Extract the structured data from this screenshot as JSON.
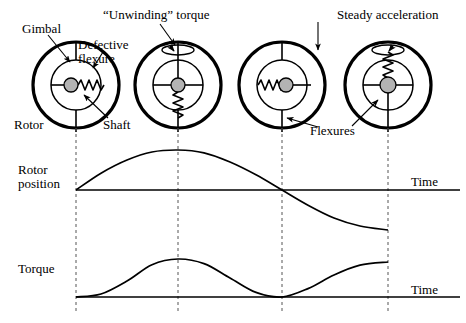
{
  "figure": {
    "background": "#ffffff",
    "ink": "#000000",
    "hub_fill": "#b3b3b3",
    "dash_color": "#555555"
  },
  "annotations": {
    "gimbal": "Gimbal",
    "defective_flexure_line1": "Defective",
    "defective_flexure_line2": "flexure",
    "unwinding_torque": "“Unwinding” torque",
    "steady_acceleration": "Steady acceleration",
    "rotor": "Rotor",
    "shaft": "Shaft",
    "flexures": "Flexures"
  },
  "axes": {
    "rotor_position_line1": "Rotor",
    "rotor_position_line2": "position",
    "torque": "Torque",
    "time_top": "Time",
    "time_bottom": "Time"
  },
  "gyros": [
    {
      "id": "gyro-1",
      "cx": 76,
      "cy": 85,
      "rotor_r": 43,
      "gimbal_r": 25,
      "hub_r": 7,
      "hub_dx": -5,
      "hub_dy": 0,
      "flexure_dir": "right",
      "flexure_state": "compressed",
      "spin_arrow": false
    },
    {
      "id": "gyro-2",
      "cx": 178,
      "cy": 85,
      "rotor_r": 43,
      "gimbal_r": 25,
      "hub_r": 7,
      "hub_dx": 0,
      "hub_dy": 0,
      "flexure_dir": "down",
      "flexure_state": "stretched",
      "spin_arrow": true,
      "spin_dir": "ccw"
    },
    {
      "id": "gyro-3",
      "cx": 282,
      "cy": 85,
      "rotor_r": 43,
      "gimbal_r": 25,
      "hub_r": 7,
      "hub_dx": 4,
      "hub_dy": 0,
      "flexure_dir": "left",
      "flexure_state": "compressed",
      "spin_arrow": false
    },
    {
      "id": "gyro-4",
      "cx": 388,
      "cy": 85,
      "rotor_r": 43,
      "gimbal_r": 25,
      "hub_r": 7,
      "hub_dx": 0,
      "hub_dy": 0,
      "flexure_dir": "up",
      "flexure_state": "stretched",
      "spin_arrow": true,
      "spin_dir": "cw"
    }
  ],
  "chart_data": {
    "type": "line",
    "xlabel": "Time",
    "grid": false,
    "gridlines_x": [
      76,
      178,
      282,
      388
    ],
    "panels": [
      {
        "name": "rotor-position",
        "ylabel": "Rotor position",
        "baseline_y": 190,
        "x_range": [
          76,
          466
        ],
        "series": [
          {
            "name": "Rotor position",
            "description": "Rises from zero at t1, peaks at t2, returns to zero at t3, falls to minimum near t4",
            "points": [
              {
                "x": 76,
                "y": 0.0
              },
              {
                "x": 101,
                "y": 0.42
              },
              {
                "x": 127,
                "y": 0.75
              },
              {
                "x": 152,
                "y": 0.95
              },
              {
                "x": 178,
                "y": 1.0
              },
              {
                "x": 204,
                "y": 0.93
              },
              {
                "x": 230,
                "y": 0.7
              },
              {
                "x": 256,
                "y": 0.38
              },
              {
                "x": 282,
                "y": 0.0
              },
              {
                "x": 308,
                "y": -0.38
              },
              {
                "x": 334,
                "y": -0.7
              },
              {
                "x": 360,
                "y": -0.9
              },
              {
                "x": 388,
                "y": -1.0
              }
            ]
          }
        ]
      },
      {
        "name": "torque",
        "ylabel": "Torque",
        "baseline_y": 297,
        "x_range": [
          76,
          466
        ],
        "series": [
          {
            "name": "Torque",
            "description": "Zero at t1, rises to peak at t2, returns to zero at t3, rises again toward t4",
            "points": [
              {
                "x": 76,
                "y": 0.0
              },
              {
                "x": 101,
                "y": 0.08
              },
              {
                "x": 127,
                "y": 0.42
              },
              {
                "x": 152,
                "y": 0.85
              },
              {
                "x": 178,
                "y": 1.0
              },
              {
                "x": 204,
                "y": 0.88
              },
              {
                "x": 230,
                "y": 0.5
              },
              {
                "x": 256,
                "y": 0.12
              },
              {
                "x": 282,
                "y": 0.0
              },
              {
                "x": 308,
                "y": 0.22
              },
              {
                "x": 334,
                "y": 0.58
              },
              {
                "x": 360,
                "y": 0.84
              },
              {
                "x": 388,
                "y": 0.92
              }
            ]
          }
        ]
      }
    ]
  }
}
